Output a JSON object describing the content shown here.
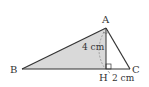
{
  "diagram": {
    "type": "triangle",
    "vertices": {
      "A": {
        "label": "A",
        "x": 106,
        "y": 28
      },
      "B": {
        "label": "B",
        "x": 22,
        "y": 69
      },
      "C": {
        "label": "C",
        "x": 130,
        "y": 69
      },
      "H": {
        "label": "H",
        "x": 106,
        "y": 69
      }
    },
    "shaded_region": "ABH",
    "measurements": {
      "AH": "4 cm",
      "HC": "2 cm"
    },
    "right_angle_at": "H",
    "colors": {
      "shade": "#d9d9d9",
      "stroke": "#333333"
    }
  }
}
